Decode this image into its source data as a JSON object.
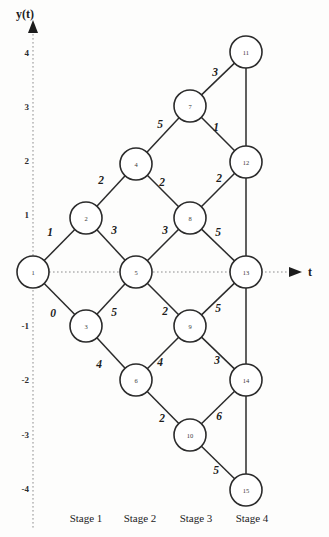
{
  "figure": {
    "background_color": "#fdfdfc",
    "node_fill": "#ffffff",
    "node_stroke": "#2b2b2b",
    "edge_stroke": "#2b2b2b",
    "axis_color": "#8d8d8d"
  },
  "axes": {
    "y_axis_name": "y(t)",
    "x_axis_name": "t",
    "y_ticks": [
      {
        "label": "4",
        "value": 4,
        "y": 53
      },
      {
        "label": "3",
        "value": 3,
        "y": 107
      },
      {
        "label": "2",
        "value": 2,
        "y": 161
      },
      {
        "label": "1",
        "value": 1,
        "y": 215
      },
      {
        "label": "-1",
        "value": -1,
        "y": 326
      },
      {
        "label": "-2",
        "value": -2,
        "y": 380
      },
      {
        "label": "-3",
        "value": -3,
        "y": 435
      },
      {
        "label": "-4",
        "value": -4,
        "y": 489
      }
    ],
    "y_axis_x": 33,
    "x_axis_y": 272
  },
  "stages": [
    {
      "label": "Stage 1",
      "x": 86
    },
    {
      "label": "Stage 2",
      "x": 140
    },
    {
      "label": "Stage 3",
      "x": 196
    },
    {
      "label": "Stage 4",
      "x": 252
    }
  ],
  "stage_label_y": 518,
  "chart_data": {
    "type": "diagram",
    "title": "",
    "xlabel": "t",
    "ylabel": "y(t)",
    "node_radius": 16,
    "nodes": [
      {
        "id": "1",
        "x": 33,
        "y": 272,
        "t": 0,
        "y_value": 0
      },
      {
        "id": "2",
        "x": 86,
        "y": 218,
        "t": 1,
        "y_value": 1
      },
      {
        "id": "3",
        "x": 86,
        "y": 326,
        "t": 1,
        "y_value": -1
      },
      {
        "id": "4",
        "x": 136,
        "y": 164,
        "t": 2,
        "y_value": 2
      },
      {
        "id": "5",
        "x": 136,
        "y": 272,
        "t": 2,
        "y_value": 0
      },
      {
        "id": "6",
        "x": 136,
        "y": 380,
        "t": 2,
        "y_value": -2
      },
      {
        "id": "7",
        "x": 190,
        "y": 106,
        "t": 3,
        "y_value": 3
      },
      {
        "id": "8",
        "x": 190,
        "y": 218,
        "t": 3,
        "y_value": 1
      },
      {
        "id": "9",
        "x": 190,
        "y": 326,
        "t": 3,
        "y_value": -1
      },
      {
        "id": "10",
        "x": 190,
        "y": 435,
        "t": 3,
        "y_value": -3
      },
      {
        "id": "11",
        "x": 246,
        "y": 52,
        "t": 4,
        "y_value": 4
      },
      {
        "id": "12",
        "x": 246,
        "y": 162,
        "t": 4,
        "y_value": 2
      },
      {
        "id": "13",
        "x": 246,
        "y": 272,
        "t": 4,
        "y_value": 0
      },
      {
        "id": "14",
        "x": 246,
        "y": 380,
        "t": 4,
        "y_value": -2
      },
      {
        "id": "15",
        "x": 246,
        "y": 490,
        "t": 4,
        "y_value": -4
      }
    ],
    "edges": [
      {
        "from": "1",
        "to": "2",
        "label": "1",
        "lx": 50,
        "ly": 232
      },
      {
        "from": "1",
        "to": "3",
        "label": "0",
        "lx": 53,
        "ly": 313
      },
      {
        "from": "2",
        "to": "4",
        "label": "2",
        "lx": 101,
        "ly": 180
      },
      {
        "from": "2",
        "to": "5",
        "label": "3",
        "lx": 114,
        "ly": 230
      },
      {
        "from": "3",
        "to": "5",
        "label": "5",
        "lx": 114,
        "ly": 312
      },
      {
        "from": "3",
        "to": "6",
        "label": "4",
        "lx": 99,
        "ly": 364
      },
      {
        "from": "4",
        "to": "7",
        "label": "5",
        "lx": 160,
        "ly": 124
      },
      {
        "from": "4",
        "to": "8",
        "label": "2",
        "lx": 162,
        "ly": 182
      },
      {
        "from": "5",
        "to": "8",
        "label": "3",
        "lx": 165,
        "ly": 230
      },
      {
        "from": "5",
        "to": "9",
        "label": "2",
        "lx": 165,
        "ly": 311
      },
      {
        "from": "6",
        "to": "9",
        "label": "4",
        "lx": 160,
        "ly": 362
      },
      {
        "from": "6",
        "to": "10",
        "label": "2",
        "lx": 162,
        "ly": 418
      },
      {
        "from": "7",
        "to": "11",
        "label": "3",
        "lx": 215,
        "ly": 72
      },
      {
        "from": "7",
        "to": "12",
        "label": "1",
        "lx": 216,
        "ly": 127
      },
      {
        "from": "8",
        "to": "12",
        "label": "2",
        "lx": 219,
        "ly": 178
      },
      {
        "from": "8",
        "to": "13",
        "label": "5",
        "lx": 218,
        "ly": 232
      },
      {
        "from": "9",
        "to": "13",
        "label": "5",
        "lx": 218,
        "ly": 308
      },
      {
        "from": "9",
        "to": "14",
        "label": "3",
        "lx": 217,
        "ly": 360
      },
      {
        "from": "10",
        "to": "14",
        "label": "6",
        "lx": 219,
        "ly": 416
      },
      {
        "from": "10",
        "to": "15",
        "label": "5",
        "lx": 216,
        "ly": 470
      }
    ],
    "vertical_edges": [
      {
        "from": "11",
        "to": "12"
      },
      {
        "from": "12",
        "to": "13"
      },
      {
        "from": "13",
        "to": "14"
      },
      {
        "from": "14",
        "to": "15"
      }
    ]
  }
}
